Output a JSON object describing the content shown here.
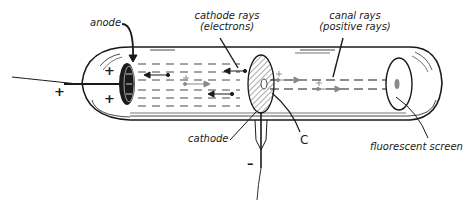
{
  "diagram": {
    "type": "cathode-canal-ray-tube",
    "labels": {
      "anode": "anode",
      "cathode_rays_line1": "cathode rays",
      "cathode_rays_line2": "(electrons)",
      "canal_rays_line1": "canal rays",
      "canal_rays_line2": "(positive rays)",
      "cathode": "cathode",
      "c": "C",
      "fluorescent_screen": "fluorescent screen"
    },
    "signs": {
      "anode_plus_top": "+",
      "anode_plus_bottom": "+",
      "wire_plus": "+",
      "cathode_minus": "–"
    },
    "colors": {
      "ink": "#1a1a1a",
      "hatch": "#555555",
      "positive_ray": "#888888",
      "screen_spot": "#8a8a8a",
      "background": "#ffffff"
    }
  }
}
